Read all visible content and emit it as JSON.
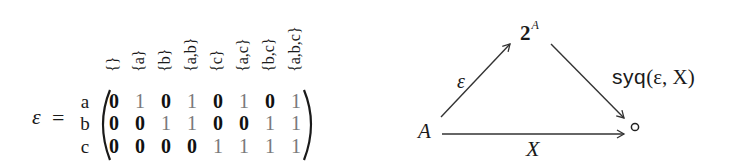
{
  "matrix": {
    "lhs_symbol": "ε",
    "equals": "=",
    "row_labels": [
      "a",
      "b",
      "c"
    ],
    "column_headers": [
      "{}",
      "{a}",
      "{b}",
      "{a,b}",
      "{c}",
      "{a,c}",
      "{b,c}",
      "{a,b,c}"
    ],
    "rows": [
      [
        "0",
        "1",
        "0",
        "1",
        "0",
        "1",
        "0",
        "1"
      ],
      [
        "0",
        "0",
        "1",
        "1",
        "0",
        "0",
        "1",
        "1"
      ],
      [
        "0",
        "0",
        "0",
        "0",
        "1",
        "1",
        "1",
        "1"
      ]
    ],
    "colors": {
      "zero": "#111111",
      "one": "#7a7a7a"
    }
  },
  "diagram": {
    "nodes": {
      "top": {
        "base": "2",
        "superscript": "A"
      },
      "left": "A",
      "right": "∘"
    },
    "arrows": [
      {
        "from": "A",
        "to": "2^A",
        "label": "ε"
      },
      {
        "from": "2^A",
        "to": "∘",
        "label_op": "syq",
        "label_args": "(ε, X)"
      },
      {
        "from": "A",
        "to": "∘",
        "label": "X"
      }
    ],
    "line_color": "#333333"
  }
}
